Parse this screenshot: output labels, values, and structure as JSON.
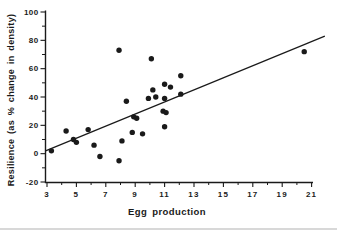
{
  "figure": {
    "background": "#ffffff",
    "ink_color": "#1a1a1a",
    "edge_artifact_color": "#d8d8d8"
  },
  "chart_data": {
    "type": "scatter",
    "title": "",
    "xlabel": "Egg production",
    "ylabel": "Resilience (as % change in density)",
    "xlim": [
      3,
      21
    ],
    "ylim": [
      -20,
      100
    ],
    "grid": false,
    "legend": null,
    "x_major_ticks": [
      3,
      5,
      7,
      9,
      11,
      13,
      15,
      17,
      19,
      21
    ],
    "x_minor_ticks": [
      4,
      6,
      8,
      10,
      12,
      14,
      16,
      18,
      20
    ],
    "y_major_ticks": [
      100,
      80,
      60,
      40,
      20,
      0,
      -20
    ],
    "y_minor_ticks": [
      90,
      70,
      50,
      30,
      10,
      -10
    ],
    "points": [
      [
        3.3,
        2
      ],
      [
        4.3,
        16
      ],
      [
        4.8,
        10
      ],
      [
        5.0,
        8
      ],
      [
        5.8,
        17
      ],
      [
        6.2,
        6
      ],
      [
        6.6,
        -2
      ],
      [
        7.9,
        -5
      ],
      [
        8.1,
        9
      ],
      [
        8.8,
        15
      ],
      [
        9.5,
        14
      ],
      [
        7.9,
        73
      ],
      [
        8.4,
        37
      ],
      [
        8.9,
        26
      ],
      [
        9.1,
        25
      ],
      [
        9.9,
        39
      ],
      [
        10.1,
        67
      ],
      [
        10.2,
        45
      ],
      [
        10.4,
        40
      ],
      [
        11.0,
        39
      ],
      [
        10.9,
        30
      ],
      [
        11.1,
        29
      ],
      [
        11.0,
        49
      ],
      [
        11.4,
        47
      ],
      [
        11.0,
        19
      ],
      [
        12.1,
        55
      ],
      [
        12.1,
        42
      ],
      [
        20.5,
        72
      ]
    ],
    "regression_line": {
      "x1": 2.9,
      "y1": 2,
      "x2": 21.9,
      "y2": 83
    }
  }
}
